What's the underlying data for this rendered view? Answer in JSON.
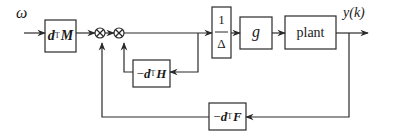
{
  "diagram": {
    "type": "control-block-diagram",
    "input_label": "ω",
    "output_label": "y(k)",
    "blocks": [
      {
        "id": "dTM",
        "prefix": "",
        "var": "d",
        "sup": "T",
        "mat": "M"
      },
      {
        "id": "inv_delta",
        "numerator": "1",
        "denominator": "Δ"
      },
      {
        "id": "g",
        "label": "g"
      },
      {
        "id": "plant",
        "label": "plant"
      },
      {
        "id": "neg_dTH",
        "prefix": "−",
        "var": "d",
        "sup": "T",
        "mat": "H"
      },
      {
        "id": "neg_dTF",
        "prefix": "−",
        "var": "d",
        "sup": "T",
        "mat": "F"
      }
    ],
    "summing_junctions": [
      {
        "id": "sum1",
        "symbol": "⊗"
      },
      {
        "id": "sum2",
        "symbol": "⊗"
      }
    ],
    "connections": [
      "ω → dTM",
      "dTM → sum1",
      "sum1 → sum2",
      "sum2 → inv_delta",
      "inv_delta → g",
      "g → plant",
      "plant → y(k)",
      "sum2 output → neg_dTH → sum2",
      "plant output → neg_dTF → sum1"
    ],
    "colors": {
      "line": "#2a2a2a",
      "box_border": "#2a2a2a",
      "background": "#ffffff"
    }
  }
}
